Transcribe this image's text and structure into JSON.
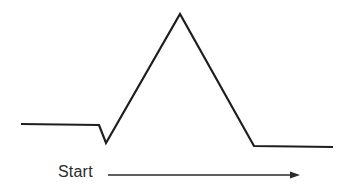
{
  "diagram": {
    "type": "waveform",
    "stroke_color": "#1e1e1e",
    "arrow_color": "#2a2a2a",
    "waveform_points": [
      [
        21,
        124
      ],
      [
        99,
        125
      ],
      [
        106,
        143
      ],
      [
        180,
        14
      ],
      [
        254,
        146
      ],
      [
        333,
        147
      ]
    ],
    "segments": [
      {
        "name": "baseline-before",
        "from": [
          21,
          124
        ],
        "to": [
          99,
          125
        ]
      },
      {
        "name": "initial-dip",
        "from": [
          99,
          125
        ],
        "to": [
          106,
          143
        ]
      },
      {
        "name": "rising-edge",
        "from": [
          106,
          143
        ],
        "to": [
          180,
          14
        ]
      },
      {
        "name": "falling-edge",
        "from": [
          180,
          14
        ],
        "to": [
          254,
          146
        ]
      },
      {
        "name": "baseline-after",
        "from": [
          254,
          146
        ],
        "to": [
          333,
          147
        ]
      }
    ],
    "arrow": {
      "from": [
        108,
        175
      ],
      "to": [
        300,
        175
      ],
      "direction": "right"
    },
    "start_label": "Start"
  }
}
